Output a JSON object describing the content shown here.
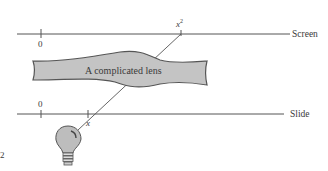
{
  "diagram": {
    "screen": {
      "label": "Screen",
      "origin_tick": "0",
      "image_tick": "x",
      "image_tick_sup": "2"
    },
    "slide": {
      "label": "Slide",
      "origin_tick": "0",
      "source_tick": "x"
    },
    "lens": {
      "label": "A complicated lens",
      "fill": "#c4c4c4",
      "stroke": "#555555"
    },
    "light_source": "light-bulb",
    "edge_mark": "2",
    "colors": {
      "line": "#555555",
      "text": "#3a3a3a",
      "bulb_fill": "#bdbdbd"
    }
  }
}
